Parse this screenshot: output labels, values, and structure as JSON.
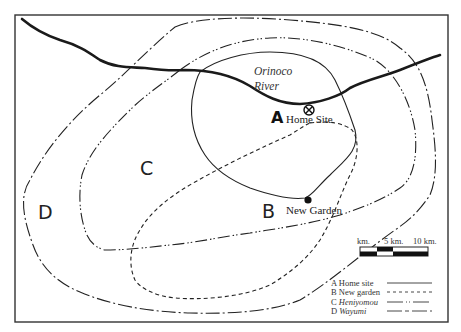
{
  "map": {
    "river": {
      "name_line1": "Orinoco",
      "name_line2": "River"
    },
    "sites": {
      "A": {
        "letter": "A",
        "name": "Home Site",
        "icon": "circled-x-icon"
      },
      "B": {
        "letter": "B",
        "name": "New Garden",
        "icon": "filled-dot-icon"
      }
    },
    "regions": {
      "C": {
        "letter": "C"
      },
      "D": {
        "letter": "D"
      }
    },
    "scale": {
      "labels": [
        "km.",
        "5 km.",
        "10 km."
      ]
    },
    "legend": [
      {
        "key": "A",
        "label": "Home site",
        "style": "solid",
        "italic": false
      },
      {
        "key": "B",
        "label": "New garden",
        "style": "dashed",
        "italic": false
      },
      {
        "key": "C",
        "label": "Heniyomou",
        "style": "dash-dot-dot",
        "italic": true
      },
      {
        "key": "D",
        "label": "Wayumi",
        "style": "dash-dot",
        "italic": true
      }
    ],
    "colors": {
      "line": "#222222",
      "frame": "#333333",
      "background": "#ffffff"
    }
  }
}
